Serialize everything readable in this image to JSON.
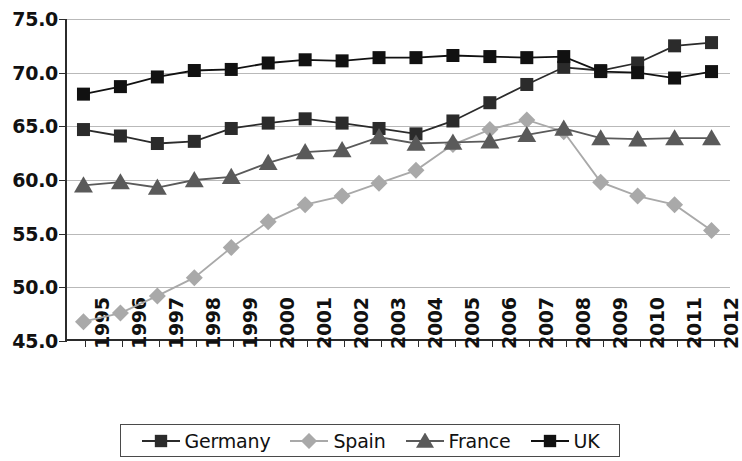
{
  "chart_data": {
    "type": "line",
    "title": "",
    "xlabel": "",
    "ylabel": "",
    "categories": [
      "1995",
      "1996",
      "1997",
      "1998",
      "1999",
      "2000",
      "2001",
      "2002",
      "2003",
      "2004",
      "2005",
      "2006",
      "2007",
      "2008",
      "2009",
      "2010",
      "2011",
      "2012"
    ],
    "x": [
      1995,
      1996,
      1997,
      1998,
      1999,
      2000,
      2001,
      2002,
      2003,
      2004,
      2005,
      2006,
      2007,
      2008,
      2009,
      2010,
      2011,
      2012
    ],
    "ylim": [
      45.0,
      75.0
    ],
    "yticks": [
      "45.0",
      "50.0",
      "55.0",
      "60.0",
      "65.0",
      "70.0",
      "75.0"
    ],
    "ytick_values": [
      45.0,
      50.0,
      55.0,
      60.0,
      65.0,
      70.0,
      75.0
    ],
    "grid": true,
    "legend_position": "bottom",
    "series": [
      {
        "name": "Germany",
        "marker": "square",
        "color": "#2b2b2b",
        "values": [
          64.7,
          64.1,
          63.4,
          63.6,
          64.8,
          65.3,
          65.7,
          65.3,
          64.8,
          64.3,
          65.5,
          67.2,
          68.9,
          70.5,
          70.2,
          70.9,
          72.5,
          72.8
        ]
      },
      {
        "name": "Spain",
        "marker": "diamond",
        "color": "#a9a9a9",
        "values": [
          46.8,
          47.6,
          49.2,
          50.9,
          53.7,
          56.1,
          57.7,
          58.5,
          59.7,
          60.9,
          63.3,
          64.7,
          65.6,
          64.5,
          59.8,
          58.5,
          57.7,
          55.3
        ]
      },
      {
        "name": "France",
        "marker": "triangle",
        "color": "#5a5a5a",
        "values": [
          59.5,
          59.8,
          59.3,
          60.0,
          60.3,
          61.6,
          62.6,
          62.8,
          64.0,
          63.4,
          63.5,
          63.6,
          64.2,
          64.8,
          63.9,
          63.8,
          63.9,
          63.9
        ]
      },
      {
        "name": "UK",
        "marker": "square",
        "color": "#111111",
        "values": [
          68.0,
          68.7,
          69.6,
          70.2,
          70.3,
          70.9,
          71.2,
          71.1,
          71.4,
          71.4,
          71.6,
          71.5,
          71.4,
          71.5,
          70.1,
          70.0,
          69.5,
          70.1
        ]
      }
    ]
  },
  "legend": {
    "items": [
      {
        "label": "Germany"
      },
      {
        "label": "Spain"
      },
      {
        "label": "France"
      },
      {
        "label": "UK"
      }
    ]
  }
}
